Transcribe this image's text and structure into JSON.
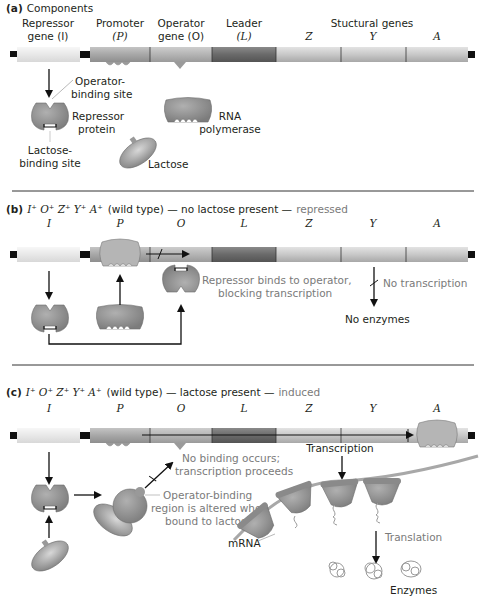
{
  "panel_a": {
    "title_prefix": "(a)",
    "title": "Components",
    "gene_labels": {
      "repressor_1": "Repressor",
      "repressor_2": "gene (I)",
      "promoter_1": "Promoter",
      "promoter_2": "(P)",
      "operator_1": "Operator",
      "operator_2": "gene (O)",
      "leader_1": "Leader",
      "leader_2": "(L)",
      "structural": "Stuctural genes",
      "z": "Z",
      "y": "Y",
      "a": "A"
    },
    "components": {
      "operator_binding_1": "Operator-",
      "operator_binding_2": "binding site",
      "repressor_1": "Repressor",
      "repressor_2": "protein",
      "lactose_binding_1": "Lactose-",
      "lactose_binding_2": "binding site",
      "rna_pol_1": "RNA",
      "rna_pol_2": "polymerase",
      "lactose": "Lactose"
    }
  },
  "panel_b": {
    "title_prefix": "(b)",
    "genotype": "I⁺ O⁺ Z⁺ Y⁺ A⁺",
    "condition": "(wild type) — no lactose present —",
    "state": "repressed",
    "gene_letters": [
      "I",
      "P",
      "O",
      "L",
      "Z",
      "Y",
      "A"
    ],
    "annotation_1": "Repressor binds to operator,",
    "annotation_2": "blocking transcription",
    "no_transcription": "No transcription",
    "no_enzymes": "No enzymes"
  },
  "panel_c": {
    "title_prefix": "(c)",
    "genotype": "I⁺ O⁺ Z⁺ Y⁺ A⁺",
    "condition": "(wild type) — lactose present —",
    "state": "induced",
    "gene_letters": [
      "I",
      "P",
      "O",
      "L",
      "Z",
      "Y",
      "A"
    ],
    "no_binding_1": "No binding occurs;",
    "no_binding_2": "transcription proceeds",
    "altered_1": "Operator-binding",
    "altered_2": "region is altered when",
    "altered_3": "bound to lactose",
    "transcription": "Transcription",
    "mrna": "mRNA",
    "translation": "Translation",
    "enzymes": "Enzymes"
  },
  "colors": {
    "repressor_gene": "#ededed",
    "promoter": "#a9a9a9",
    "operator": "#b5b5b5",
    "leader": "#6f6f6f",
    "structural": "#c9c9c9",
    "protein": "#8f8f8f",
    "gray_text": "#7a7a7a"
  }
}
